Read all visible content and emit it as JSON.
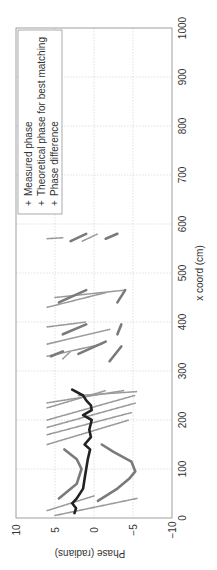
{
  "chart_data": {
    "type": "scatter",
    "orientation": "rotated-90-ccw",
    "title": "",
    "xlabel": "x coord (cm)",
    "ylabel": "Phase (radians)",
    "xlim": [
      0,
      1000
    ],
    "ylim": [
      -10,
      10
    ],
    "xticks": [
      "0",
      "100",
      "200",
      "300",
      "400",
      "500",
      "600",
      "700",
      "800",
      "900",
      "1000"
    ],
    "yticks": [
      "10",
      "5",
      "0",
      "−5",
      "−10"
    ],
    "grid": true,
    "legend": {
      "position": "upper-left",
      "entries": [
        "Measured phase",
        "Theoretical phase for best matching",
        "Phase difference"
      ]
    },
    "colors": {
      "measured": "#9a9a9a",
      "theoretical": "#7a7a7a",
      "difference": "#222222",
      "grid": "#cccccc",
      "axis": "#888888"
    },
    "series": [
      {
        "name": "Measured phase",
        "segments": [
          [
            [
              5,
              5
            ],
            [
              40,
              -5.5
            ]
          ],
          [
            [
              15,
              6
            ],
            [
              45,
              0
            ]
          ],
          [
            [
              150,
              6
            ],
            [
              200,
              -4.5
            ]
          ],
          [
            [
              170,
              6
            ],
            [
              215,
              -4.8
            ]
          ],
          [
            [
              185,
              6
            ],
            [
              235,
              -5.4
            ]
          ],
          [
            [
              200,
              6
            ],
            [
              250,
              -5.2
            ]
          ],
          [
            [
              225,
              6
            ],
            [
              260,
              -1.5
            ]
          ],
          [
            [
              235,
              6
            ],
            [
              260,
              -3.8
            ]
          ],
          [
            [
              250,
              2
            ],
            [
              258,
              -5.5
            ]
          ],
          [
            [
              325,
              4
            ],
            [
              340,
              3
            ]
          ],
          [
            [
              330,
              6
            ],
            [
              355,
              -1
            ]
          ],
          [
            [
              355,
              6
            ],
            [
              385,
              -2
            ]
          ],
          [
            [
              390,
              6
            ],
            [
              400,
              1
            ]
          ],
          [
            [
              430,
              6
            ],
            [
              460,
              -1.5
            ]
          ],
          [
            [
              450,
              5
            ],
            [
              465,
              -4
            ]
          ],
          [
            [
              570,
              6
            ],
            [
              572,
              4
            ]
          ],
          [
            [
              565,
              1.5
            ],
            [
              580,
              -0.5
            ]
          ]
        ]
      },
      {
        "name": "Theoretical phase for best matching",
        "segments": [
          [
            [
              40,
              4.5
            ],
            [
              70,
              2.2
            ],
            [
              100,
              1.6
            ],
            [
              120,
              2.2
            ],
            [
              140,
              3.8
            ]
          ],
          [
            [
              35,
              -0.5
            ],
            [
              60,
              -3
            ],
            [
              80,
              -4.5
            ],
            [
              95,
              -5.3
            ],
            [
              115,
              -4.8
            ],
            [
              135,
              -2.5
            ],
            [
              150,
              -1
            ]
          ],
          [
            [
              330,
              5.5
            ],
            [
              340,
              4
            ]
          ],
          [
            [
              335,
              2
            ],
            [
              360,
              -1.5
            ]
          ],
          [
            [
              320,
              -2
            ],
            [
              350,
              -3.5
            ]
          ],
          [
            [
              375,
              4
            ],
            [
              395,
              1
            ]
          ],
          [
            [
              375,
              -3
            ],
            [
              395,
              -3.5
            ]
          ],
          [
            [
              440,
              4.5
            ],
            [
              465,
              1
            ]
          ],
          [
            [
              440,
              -3
            ],
            [
              465,
              -4
            ]
          ],
          [
            [
              565,
              3
            ],
            [
              580,
              1
            ]
          ],
          [
            [
              570,
              -1.5
            ],
            [
              580,
              -3
            ]
          ]
        ]
      },
      {
        "name": "Phase difference",
        "segments": [
          [
            [
              10,
              2.5
            ],
            [
              20,
              2.3
            ],
            [
              30,
              2.8
            ],
            [
              40,
              2.2
            ],
            [
              60,
              1.4
            ],
            [
              80,
              1.2
            ],
            [
              100,
              1.0
            ],
            [
              120,
              0.8
            ],
            [
              140,
              0.5
            ],
            [
              150,
              1.2
            ],
            [
              165,
              0.4
            ],
            [
              180,
              0.6
            ],
            [
              200,
              0.3
            ],
            [
              210,
              1.4
            ],
            [
              220,
              0.3
            ],
            [
              230,
              0.4
            ],
            [
              240,
              1.0
            ],
            [
              250,
              1.4
            ],
            [
              262,
              2.8
            ]
          ]
        ]
      }
    ]
  }
}
